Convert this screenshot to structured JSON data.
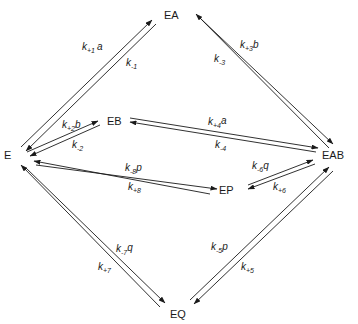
{
  "diagram": {
    "type": "enzyme kinetic mechanism",
    "nodes": {
      "E": {
        "label": "E",
        "x": 4,
        "y": 159
      },
      "EA": {
        "label": "EA",
        "x": 164,
        "y": 19
      },
      "EB": {
        "label": "EB",
        "x": 107,
        "y": 125
      },
      "EAB": {
        "label": "EAB",
        "x": 322,
        "y": 159
      },
      "EP": {
        "label": "EP",
        "x": 219,
        "y": 194
      },
      "EQ": {
        "label": "EQ",
        "x": 170,
        "y": 318
      }
    },
    "labels": {
      "k1_fwd": {
        "k": "k",
        "sub": "+1",
        "suffix": "a"
      },
      "k1_rev": {
        "k": "k",
        "sub": "-1",
        "suffix": ""
      },
      "k2_fwd": {
        "k": "k",
        "sub": "+2",
        "suffix": "b"
      },
      "k2_rev": {
        "k": "k",
        "sub": "-2",
        "suffix": ""
      },
      "k3_fwd": {
        "k": "k",
        "sub": "+3",
        "suffix": "b"
      },
      "k3_rev": {
        "k": "k",
        "sub": "-3",
        "suffix": ""
      },
      "k4_fwd": {
        "k": "k",
        "sub": "+4",
        "suffix": "a"
      },
      "k4_rev": {
        "k": "k",
        "sub": "-4",
        "suffix": ""
      },
      "k5_fwd": {
        "k": "k",
        "sub": "+5",
        "suffix": ""
      },
      "k5_rev": {
        "k": "k",
        "sub": "-5",
        "suffix": "p"
      },
      "k6_fwd": {
        "k": "k",
        "sub": "+6",
        "suffix": ""
      },
      "k6_rev": {
        "k": "k",
        "sub": "-6",
        "suffix": "q"
      },
      "k7_fwd": {
        "k": "k",
        "sub": "+7",
        "suffix": ""
      },
      "k7_rev": {
        "k": "k",
        "sub": "-7",
        "suffix": "q"
      },
      "k8_fwd": {
        "k": "k",
        "sub": "+8",
        "suffix": ""
      },
      "k8_rev": {
        "k": "k",
        "sub": "-8",
        "suffix": "p"
      }
    },
    "edges": [
      {
        "from": "E",
        "to": "EA",
        "forward": "k_{+1}a",
        "reverse": "k_{-1}"
      },
      {
        "from": "E",
        "to": "EB",
        "forward": "k_{+2}b",
        "reverse": "k_{-2}"
      },
      {
        "from": "EA",
        "to": "EAB",
        "forward": "k_{+3}b",
        "reverse": "k_{-3}"
      },
      {
        "from": "EB",
        "to": "EAB",
        "forward": "k_{+4}a",
        "reverse": "k_{-4}"
      },
      {
        "from": "EAB",
        "to": "EQ",
        "forward": "k_{+5}",
        "reverse": "k_{-5}p"
      },
      {
        "from": "EAB",
        "to": "EP",
        "forward": "k_{+6}",
        "reverse": "k_{-6}q"
      },
      {
        "from": "EQ",
        "to": "E",
        "forward": "k_{+7}",
        "reverse": "k_{-7}q"
      },
      {
        "from": "EP",
        "to": "E",
        "forward": "k_{+8}",
        "reverse": "k_{-8}p"
      }
    ]
  }
}
